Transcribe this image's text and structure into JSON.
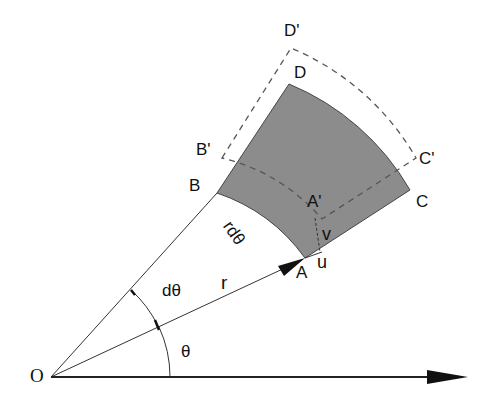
{
  "diagram": {
    "colors": {
      "element_fill": "#8c8c8c",
      "line": "#222222",
      "dashed": "#555555",
      "background": "#ffffff"
    },
    "labels": {
      "origin": "O",
      "A": "A",
      "B": "B",
      "C": "C",
      "D": "D",
      "A_prime": "A'",
      "B_prime": "B'",
      "C_prime": "C'",
      "D_prime": "D'",
      "arc_length": "rdθ",
      "radius": "r",
      "dtheta": "dθ",
      "theta": "θ",
      "u": "u",
      "v": "v"
    }
  }
}
